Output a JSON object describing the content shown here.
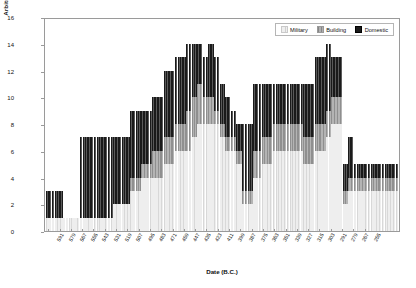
{
  "chart_data": {
    "type": "bar",
    "stacked": true,
    "title": "",
    "xlabel": "Date (B.C.)",
    "ylabel": "Arbitrary 15-point scale",
    "ylim": [
      0,
      16
    ],
    "yticks": [
      0,
      2,
      4,
      6,
      8,
      10,
      12,
      14,
      16
    ],
    "grid": false,
    "legend_position": "top-right",
    "legend": [
      "Military",
      "Building",
      "Domestic"
    ],
    "series": [
      {
        "name": "Military",
        "color": "#eeeeee",
        "values": [
          1,
          1,
          1,
          1,
          1,
          1,
          1,
          1,
          1,
          1,
          1,
          1,
          1,
          1,
          1,
          1,
          1,
          1,
          1,
          1,
          1,
          1,
          1,
          1,
          2,
          2,
          2,
          2,
          2,
          2,
          3,
          3,
          3,
          3,
          4,
          4,
          4,
          4,
          4,
          4,
          4,
          4,
          5,
          5,
          5,
          5,
          6,
          6,
          6,
          6,
          6,
          6,
          7,
          7,
          8,
          8,
          8,
          8,
          8,
          8,
          8,
          8,
          7,
          7,
          6,
          6,
          6,
          6,
          5,
          5,
          2,
          2,
          2,
          2,
          4,
          4,
          4,
          5,
          5,
          5,
          5,
          6,
          6,
          6,
          6,
          6,
          6,
          6,
          6,
          6,
          6,
          6,
          5,
          5,
          5,
          5,
          6,
          6,
          6,
          6,
          7,
          7,
          8,
          8,
          8,
          8,
          2,
          2,
          3,
          3,
          3,
          3,
          3,
          3,
          3,
          3,
          3,
          3,
          3,
          3,
          3,
          3,
          3,
          3,
          3,
          3,
          4,
          4,
          4,
          4,
          4,
          4
        ]
      },
      {
        "name": "Building",
        "color": "#b4b4b4",
        "values": [
          0,
          0,
          0,
          0,
          0,
          0,
          0,
          0,
          0,
          0,
          0,
          0,
          0,
          0,
          0,
          0,
          0,
          0,
          0,
          0,
          0,
          0,
          0,
          0,
          0,
          0,
          0,
          0,
          0,
          0,
          1,
          1,
          1,
          1,
          1,
          1,
          1,
          1,
          2,
          2,
          2,
          2,
          2,
          2,
          2,
          2,
          2,
          2,
          2,
          2,
          3,
          3,
          3,
          3,
          3,
          3,
          2,
          2,
          2,
          2,
          1,
          1,
          1,
          1,
          1,
          1,
          1,
          1,
          1,
          1,
          1,
          1,
          1,
          1,
          2,
          2,
          2,
          2,
          2,
          2,
          2,
          2,
          2,
          2,
          2,
          2,
          2,
          2,
          2,
          2,
          2,
          2,
          2,
          2,
          2,
          2,
          2,
          2,
          2,
          2,
          2,
          2,
          2,
          2,
          2,
          2,
          1,
          1,
          1,
          1,
          1,
          1,
          1,
          1,
          1,
          1,
          1,
          1,
          1,
          1,
          1,
          1,
          1,
          1,
          1,
          1,
          0,
          0,
          0,
          0,
          0,
          0
        ]
      },
      {
        "name": "Domestic",
        "color": "#1a1a1a",
        "values": [
          2,
          2,
          2,
          2,
          2,
          2,
          0,
          0,
          0,
          0,
          0,
          0,
          6,
          6,
          6,
          6,
          6,
          6,
          6,
          6,
          6,
          6,
          6,
          6,
          5,
          5,
          5,
          5,
          5,
          5,
          5,
          5,
          5,
          5,
          4,
          4,
          4,
          4,
          4,
          4,
          4,
          4,
          5,
          5,
          5,
          5,
          5,
          5,
          5,
          5,
          5,
          5,
          4,
          4,
          3,
          3,
          3,
          3,
          4,
          4,
          4,
          4,
          3,
          3,
          3,
          3,
          2,
          2,
          2,
          2,
          5,
          5,
          5,
          5,
          5,
          5,
          5,
          4,
          4,
          4,
          4,
          3,
          3,
          3,
          3,
          3,
          3,
          3,
          3,
          3,
          3,
          3,
          4,
          4,
          4,
          4,
          5,
          5,
          5,
          5,
          5,
          5,
          3,
          3,
          3,
          3,
          2,
          2,
          3,
          3,
          1,
          1,
          1,
          1,
          1,
          1,
          1,
          1,
          1,
          1,
          1,
          1,
          1,
          1,
          1,
          1,
          0,
          0,
          0,
          0,
          0,
          0
        ]
      }
    ],
    "xticklabels": [
      "591",
      "579",
      "567",
      "555",
      "543",
      "531",
      "519",
      "507",
      "495",
      "483",
      "471",
      "459",
      "447",
      "435",
      "423",
      "411",
      "399",
      "387",
      "375",
      "363",
      "351",
      "339",
      "327",
      "315",
      "303",
      "291",
      "279",
      "267",
      "255"
    ],
    "n_bars": 126
  },
  "legend": {
    "military": "Military",
    "building": "Building",
    "domestic": "Domestic"
  },
  "axes": {
    "x_title": "Date (B.C.)",
    "y_title": "Arbitrary 15-point scale"
  }
}
